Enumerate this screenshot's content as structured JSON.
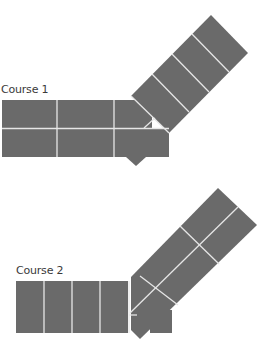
{
  "diagram": {
    "colors": {
      "brick": "#6a6a6a",
      "mortar": "#e6e6e6",
      "background": "#ffffff",
      "label": "#3a3a3a"
    },
    "courses": [
      {
        "label": "Course 1"
      },
      {
        "label": "Course 2"
      }
    ]
  }
}
